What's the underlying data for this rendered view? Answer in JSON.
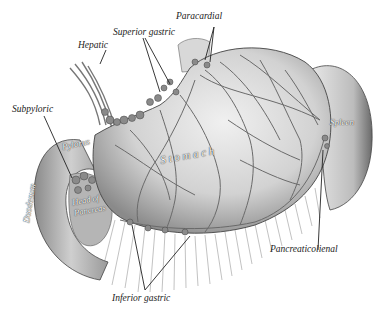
{
  "figure": {
    "type": "anatomical-illustration",
    "colors": {
      "background": "#ffffff",
      "tissue_light": "#e4e4e4",
      "tissue_mid": "#bdbdbd",
      "tissue_dark": "#7a7a7a",
      "vessels": "#6a6a6a",
      "label_text": "#222222"
    }
  },
  "labels": {
    "superior_gastric": "Superior gastric",
    "paracardial": "Paracardial",
    "hepatic": "Hepatic",
    "subpyloric": "Subpyloric",
    "pancreaticolienal": "Pancreaticolienal",
    "inferior_gastric": "Inferior gastric"
  },
  "organs": {
    "stomach": "S t o m a c h",
    "spleen": "Spleen",
    "pylorus": "Pylorus",
    "duodenum": "Duodenum",
    "head_of_pancreas_1": "Head of",
    "head_of_pancreas_2": "Pancreas"
  }
}
